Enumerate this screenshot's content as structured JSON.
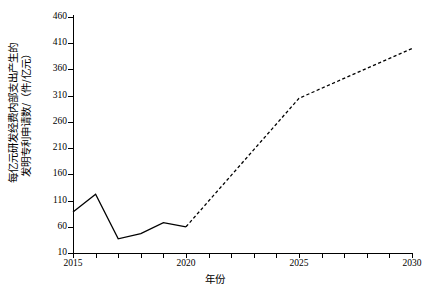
{
  "chart_data": {
    "type": "line",
    "title": "",
    "xlabel": "年份",
    "ylabel": "每亿元研发经费内部支出产生的\n发明专利申请数/（件/亿元）",
    "ylabel_line1": "每亿元研发经费内部支出产生的",
    "ylabel_line2": "发明专利申请数/（件/亿元）",
    "xlim": [
      2015,
      2030
    ],
    "ylim": [
      10,
      460
    ],
    "xticks": [
      2015,
      2016,
      2017,
      2018,
      2019,
      2020,
      2021,
      2022,
      2023,
      2024,
      2025,
      2026,
      2027,
      2028,
      2029,
      2030
    ],
    "xtick_labels_shown": [
      "2015",
      "2020",
      "2025",
      "2030"
    ],
    "yticks": [
      10,
      60,
      110,
      160,
      210,
      260,
      310,
      360,
      410,
      460
    ],
    "ytick_labels": [
      "10",
      "60",
      "110",
      "160",
      "210",
      "260",
      "310",
      "360",
      "410",
      "460"
    ],
    "grid": false,
    "legend": "none",
    "line_color": "#000000",
    "background": "#ffffff",
    "series": [
      {
        "name": "历史值",
        "style": "solid",
        "x": [
          2015,
          2016,
          2017,
          2018,
          2019,
          2020
        ],
        "values": [
          88,
          122,
          37,
          47,
          68,
          60
        ]
      },
      {
        "name": "预测值",
        "style": "dashed",
        "x": [
          2020,
          2025,
          2030
        ],
        "values": [
          60,
          305,
          400
        ]
      }
    ]
  },
  "axes": {
    "x_title": "年份",
    "y_title_line1": "每亿元研发经费内部支出产生的",
    "y_title_line2": "发明专利申请数/（件/亿元）"
  }
}
